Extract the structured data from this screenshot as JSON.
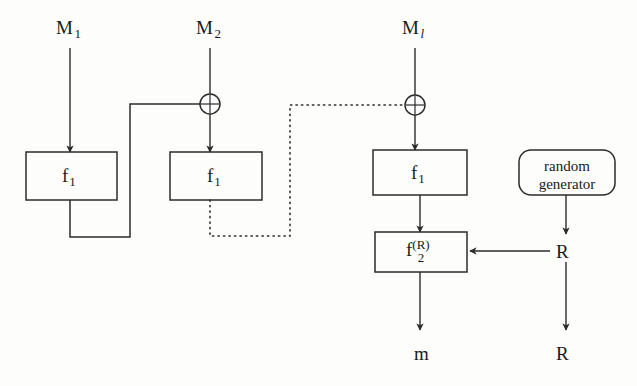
{
  "figure": {
    "type": "block-diagram",
    "background_color": "#fdfdfc",
    "line_color": "#2b2b2b"
  },
  "inputs": [
    {
      "id": "m1",
      "base": "M",
      "subscript": "1",
      "subscript_italic": false,
      "x": 56,
      "y": 18
    },
    {
      "id": "m2",
      "base": "M",
      "subscript": "2",
      "subscript_italic": false,
      "x": 196,
      "y": 18
    },
    {
      "id": "ml",
      "base": "M",
      "subscript": "l",
      "subscript_italic": true,
      "x": 402,
      "y": 18
    }
  ],
  "blocks": [
    {
      "id": "f1_first",
      "label": "f",
      "subscript": "1",
      "x": 26,
      "y": 152,
      "w": 91,
      "h": 48
    },
    {
      "id": "f1_second",
      "label": "f",
      "subscript": "1",
      "x": 170,
      "y": 152,
      "w": 92,
      "h": 48
    },
    {
      "id": "f1_last",
      "label": "f",
      "subscript": "1",
      "x": 373,
      "y": 150,
      "w": 94,
      "h": 45
    },
    {
      "id": "f2_r",
      "label": "f",
      "subscript": "2",
      "superscript": "(R)",
      "x": 375,
      "y": 232,
      "w": 92,
      "h": 40
    }
  ],
  "random_generator": {
    "id": "random_generator",
    "line1": "random",
    "line2": "generator",
    "x": 519,
    "y": 150,
    "w": 96,
    "h": 45,
    "shape": "rounded-rectangle"
  },
  "operators": [
    {
      "id": "xor1",
      "symbol": "⊕",
      "name": "xor-gate",
      "cx": 210,
      "cy": 104,
      "r": 10
    },
    {
      "id": "xor2",
      "symbol": "⊕",
      "name": "xor-gate",
      "cx": 415,
      "cy": 105,
      "r": 10
    }
  ],
  "outputs": [
    {
      "id": "m_out",
      "text": "m",
      "x": 414,
      "y": 344
    },
    {
      "id": "r_out",
      "text": "R",
      "x": 556,
      "y": 344
    },
    {
      "id": "r_mid",
      "text": "R",
      "x": 556,
      "y": 242
    }
  ],
  "connections": [
    {
      "id": "m1-to-f1first",
      "from": "M1",
      "to": "f1_first",
      "style": "solid",
      "arrow": true
    },
    {
      "id": "m2-to-xor1",
      "from": "M2",
      "to": "xor1",
      "style": "solid",
      "arrow": true
    },
    {
      "id": "xor1-to-f1second",
      "from": "xor1",
      "to": "f1_second",
      "style": "solid",
      "arrow": true
    },
    {
      "id": "f1first-feedback-xor1",
      "from": "f1_first",
      "to": "xor1",
      "style": "solid",
      "arrow": false
    },
    {
      "id": "f1second-feedback-xor2",
      "from": "f1_second",
      "to": "xor2",
      "style": "dotted",
      "arrow": false
    },
    {
      "id": "ml-to-xor2",
      "from": "Ml",
      "to": "xor2",
      "style": "solid",
      "arrow": true
    },
    {
      "id": "xor2-to-f1last",
      "from": "xor2",
      "to": "f1_last",
      "style": "solid",
      "arrow": true
    },
    {
      "id": "f1last-to-f2r",
      "from": "f1_last",
      "to": "f2_r",
      "style": "solid",
      "arrow": true
    },
    {
      "id": "randomgen-to-R",
      "from": "random_generator",
      "to": "R",
      "style": "solid",
      "arrow": true
    },
    {
      "id": "R-to-f2r",
      "from": "R",
      "to": "f2_r",
      "style": "solid",
      "arrow": true
    },
    {
      "id": "R-to-Rout",
      "from": "R",
      "to": "R_out",
      "style": "solid",
      "arrow": true
    },
    {
      "id": "f2r-to-m",
      "from": "f2_r",
      "to": "m",
      "style": "solid",
      "arrow": true
    }
  ]
}
